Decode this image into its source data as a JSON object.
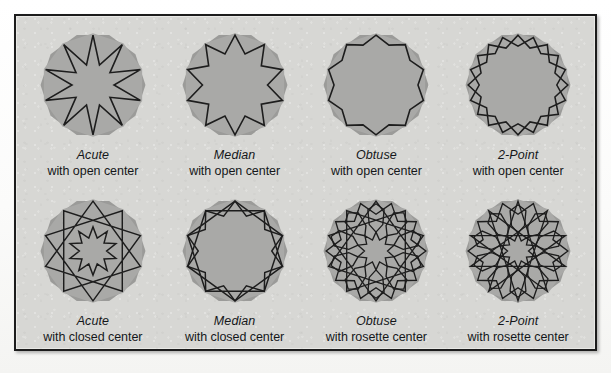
{
  "figure": {
    "panel_bg": "#d7d7d4",
    "panel_border": "#1c1c1c",
    "tile_fill": "#a9a9a7",
    "tile_under_fill": "#9b9b99",
    "line_color": "#1d1d1d"
  },
  "cells": [
    {
      "name": "Acute",
      "desc": "with open center",
      "pattern": "acute-open-center",
      "sides": 10,
      "center": "open",
      "contact_angle": "acute"
    },
    {
      "name": "Median",
      "desc": "with open center",
      "pattern": "median-open-center",
      "sides": 10,
      "center": "open",
      "contact_angle": "median"
    },
    {
      "name": "Obtuse",
      "desc": "with open center",
      "pattern": "obtuse-open-center",
      "sides": 10,
      "center": "open",
      "contact_angle": "obtuse"
    },
    {
      "name": "2-Point",
      "desc": "with open center",
      "pattern": "two-point-open-center",
      "sides": 10,
      "center": "open",
      "contact_angle": "two-point"
    },
    {
      "name": "Acute",
      "desc": "with closed center",
      "pattern": "acute-closed-center",
      "sides": 10,
      "center": "closed",
      "contact_angle": "acute"
    },
    {
      "name": "Median",
      "desc": "with closed center",
      "pattern": "median-closed-center",
      "sides": 10,
      "center": "closed",
      "contact_angle": "median"
    },
    {
      "name": "Obtuse",
      "desc": "with rosette center",
      "pattern": "obtuse-rosette-center",
      "sides": 10,
      "center": "rosette",
      "contact_angle": "obtuse"
    },
    {
      "name": "2-Point",
      "desc": "with rosette center",
      "pattern": "two-point-rosette-center",
      "sides": 10,
      "center": "rosette",
      "contact_angle": "two-point"
    }
  ]
}
